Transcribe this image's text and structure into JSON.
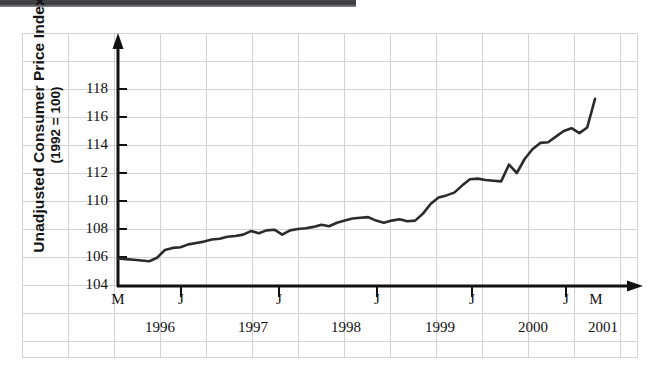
{
  "figure": {
    "top_bar_color": "#3b3b3f",
    "background": "#ffffff",
    "grid_color": "#d3d3d6",
    "axis_color": "#111111",
    "line_color": "#2b2b2b"
  },
  "axes": {
    "y_title_main": "Unadjusted Consumer Price Index",
    "y_title_sub": "(1992 = 100)",
    "y_ticks": [
      "104",
      "106",
      "108",
      "110",
      "112",
      "114",
      "116",
      "118"
    ],
    "x_ticks": [
      "M",
      "J",
      "J",
      "J",
      "J",
      "J",
      "M"
    ],
    "x_years": [
      "1996",
      "1997",
      "1998",
      "1999",
      "2000",
      "2001"
    ]
  },
  "chart_data": {
    "type": "line",
    "title": "",
    "subtitle": "",
    "xlabel": "",
    "ylabel": "Unadjusted Consumer Price Index (1992 = 100)",
    "ylim": [
      104,
      118.8
    ],
    "xlim": [
      0,
      61
    ],
    "ytick_values": [
      104,
      106,
      108,
      110,
      112,
      114,
      116,
      118
    ],
    "ytick_step": 2,
    "grid": true,
    "legend": null,
    "x_tick_labels": [
      "M",
      "J",
      "J",
      "J",
      "J",
      "J",
      "M"
    ],
    "x_tick_positions": [
      0,
      13,
      25,
      37,
      49,
      61,
      65
    ],
    "x_year_labels": [
      "1996",
      "1997",
      "1998",
      "1999",
      "2000",
      "2001"
    ],
    "x_axis_note": "Monthly index, March 1996 through March 2001; J marks July of each year",
    "series": [
      {
        "name": "Unadjusted CPI",
        "color": "#2b2b2b",
        "x": [
          0,
          1,
          2,
          3,
          4,
          5,
          6,
          7,
          8,
          9,
          10,
          11,
          12,
          13,
          14,
          15,
          16,
          17,
          18,
          19,
          20,
          21,
          22,
          23,
          24,
          25,
          26,
          27,
          28,
          29,
          30,
          31,
          32,
          33,
          34,
          35,
          36,
          37,
          38,
          39,
          40,
          41,
          42,
          43,
          44,
          45,
          46,
          47,
          48,
          49,
          50,
          51,
          52,
          53,
          54,
          55,
          56,
          57,
          58,
          59,
          60,
          61
        ],
        "values": [
          105.9,
          105.85,
          105.8,
          105.75,
          105.7,
          105.95,
          106.5,
          106.65,
          106.7,
          106.9,
          107.0,
          107.1,
          107.25,
          107.3,
          107.45,
          107.5,
          107.6,
          107.85,
          107.7,
          107.9,
          107.95,
          107.6,
          107.9,
          108.0,
          108.05,
          108.15,
          108.3,
          108.2,
          108.45,
          108.6,
          108.75,
          108.8,
          108.85,
          108.6,
          108.45,
          108.6,
          108.7,
          108.55,
          108.6,
          109.1,
          109.8,
          110.25,
          110.4,
          110.6,
          111.1,
          111.55,
          111.6,
          111.5,
          111.45,
          111.4,
          112.6,
          112.0,
          113.0,
          113.7,
          114.15,
          114.2,
          114.6,
          115.0,
          115.2,
          114.85,
          115.25,
          117.3
        ]
      }
    ]
  }
}
